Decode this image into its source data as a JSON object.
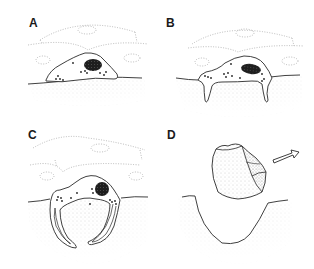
{
  "figure": {
    "panels": [
      {
        "id": "A",
        "label": "A",
        "description": "Cell resting on epithelial surface above stippled tissue"
      },
      {
        "id": "B",
        "label": "B",
        "description": "Cell extends processes downward into tissue"
      },
      {
        "id": "C",
        "label": "C",
        "description": "Processes elongate and curve around underlying tissue"
      },
      {
        "id": "D",
        "label": "D",
        "description": "Cell detaches and departs, leaving a crater; arrow indicates direction"
      }
    ],
    "colors": {
      "line": "#2a2a2a",
      "dotted_line": "#9a9a9a",
      "stipple": "#bdbdbd",
      "nucleus": "#1e1e1e",
      "background": "#ffffff"
    },
    "arrow_direction": "up-right"
  }
}
